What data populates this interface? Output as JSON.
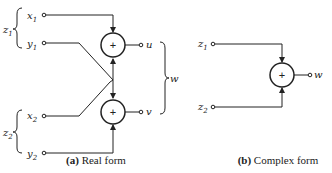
{
  "real_form": {
    "caption_letter": "(a)",
    "caption_text": " Real form",
    "inputs": {
      "z1": {
        "label": "z",
        "sub": "1",
        "x": {
          "label": "x",
          "sub": "1"
        },
        "y": {
          "label": "y",
          "sub": "1"
        }
      },
      "z2": {
        "label": "z",
        "sub": "2",
        "x": {
          "label": "x",
          "sub": "2"
        },
        "y": {
          "label": "y",
          "sub": "2"
        }
      }
    },
    "adders": [
      "+",
      "+"
    ],
    "outputs": {
      "u": "u",
      "v": "v",
      "group": "w"
    }
  },
  "complex_form": {
    "caption_letter": "(b)",
    "caption_text": " Complex form",
    "inputs": [
      {
        "label": "z",
        "sub": "1"
      },
      {
        "label": "z",
        "sub": "2"
      }
    ],
    "adder": "+",
    "output": "w"
  }
}
